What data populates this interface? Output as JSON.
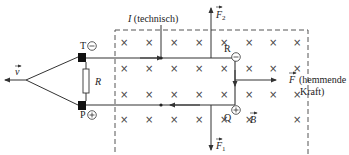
{
  "diagram": {
    "labels": {
      "velocity": "v",
      "resistor": "R",
      "current": "I",
      "current_note": "(technisch)",
      "force_top": "F",
      "force_top_sub": "2",
      "force_bottom": "F",
      "force_bottom_sub": "1",
      "force_right": "F",
      "force_right_note_1": "(hemmende",
      "force_right_note_2": "Kraft)",
      "field": "B",
      "point_T": "T",
      "point_P": "P",
      "point_R": "R",
      "point_Q": "Q",
      "minus": "−",
      "plus": "+"
    },
    "field_symbol": "×",
    "colors": {
      "line": "#333333",
      "dashed_box": "#555555",
      "contact": "#111111",
      "text": "#222222"
    }
  }
}
